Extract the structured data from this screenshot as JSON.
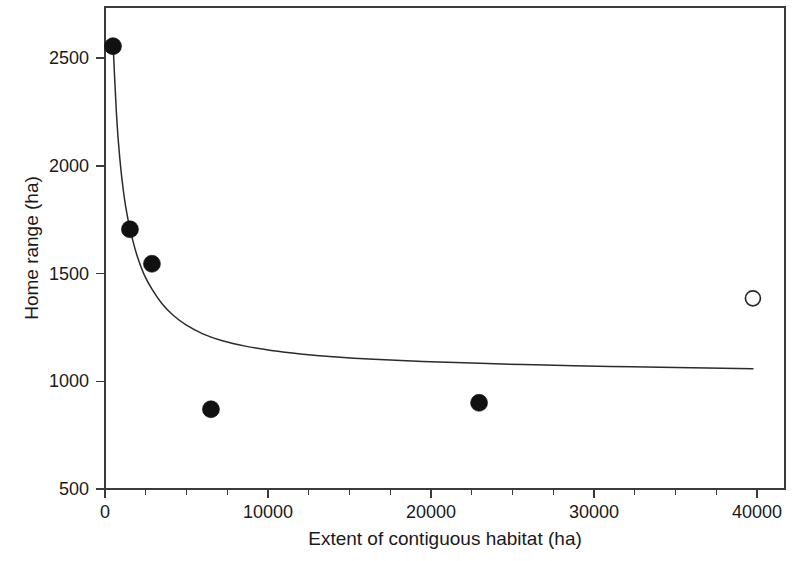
{
  "chart_data": {
    "type": "scatter",
    "title": "",
    "xlabel": "Extent of contiguous habitat (ha)",
    "ylabel": "Home range (ha)",
    "xlim": [
      0,
      42000
    ],
    "ylim": [
      500,
      2700
    ],
    "grid": false,
    "legend": "none",
    "xticks": [
      0,
      10000,
      20000,
      30000,
      40000
    ],
    "xtick_labels": [
      "0",
      "10000",
      "20000",
      "30000",
      "40000"
    ],
    "xminor_ticks": [
      2500,
      5000,
      7500,
      12500,
      15000,
      17500,
      22500,
      25000,
      27500,
      32500,
      35000,
      37500
    ],
    "yticks": [
      500,
      1000,
      1500,
      2000,
      2500
    ],
    "ytick_labels": [
      "500",
      "1000",
      "1500",
      "2000",
      "2500"
    ],
    "series": [
      {
        "name": "observed-filled",
        "marker": "filled-circle",
        "color": "#111111",
        "points": [
          {
            "x": 490,
            "y": 2555
          },
          {
            "x": 1530,
            "y": 1705
          },
          {
            "x": 2880,
            "y": 1545
          },
          {
            "x": 6500,
            "y": 870
          },
          {
            "x": 22950,
            "y": 900
          }
        ]
      },
      {
        "name": "observed-open",
        "marker": "open-circle",
        "color": "#ffffff",
        "points": [
          {
            "x": 39750,
            "y": 1385
          }
        ]
      },
      {
        "name": "fitted-curve",
        "marker": "line",
        "color": "#2b2b2b",
        "points": [
          {
            "x": 490,
            "y": 2575
          },
          {
            "x": 700,
            "y": 2245
          },
          {
            "x": 900,
            "y": 2040
          },
          {
            "x": 1150,
            "y": 1870
          },
          {
            "x": 1400,
            "y": 1755
          },
          {
            "x": 1700,
            "y": 1655
          },
          {
            "x": 2000,
            "y": 1575
          },
          {
            "x": 2400,
            "y": 1495
          },
          {
            "x": 2900,
            "y": 1425
          },
          {
            "x": 3500,
            "y": 1360
          },
          {
            "x": 4200,
            "y": 1305
          },
          {
            "x": 5000,
            "y": 1260
          },
          {
            "x": 6000,
            "y": 1220
          },
          {
            "x": 7200,
            "y": 1188
          },
          {
            "x": 8600,
            "y": 1163
          },
          {
            "x": 10200,
            "y": 1143
          },
          {
            "x": 12000,
            "y": 1127
          },
          {
            "x": 14000,
            "y": 1114
          },
          {
            "x": 16500,
            "y": 1102
          },
          {
            "x": 19500,
            "y": 1092
          },
          {
            "x": 23000,
            "y": 1083
          },
          {
            "x": 27000,
            "y": 1075
          },
          {
            "x": 31000,
            "y": 1069
          },
          {
            "x": 35000,
            "y": 1064
          },
          {
            "x": 39750,
            "y": 1058
          }
        ]
      }
    ]
  },
  "geometry": {
    "plot_left": 105,
    "plot_right": 785,
    "plot_top": 7,
    "plot_bottom": 489,
    "x_min_px": 105,
    "x_max_px": 757,
    "x_min_val": 0,
    "x_max_val": 40000,
    "y_min_px": 489,
    "y_max_px": 58,
    "y_min_val": 500,
    "y_max_val": 2500
  }
}
